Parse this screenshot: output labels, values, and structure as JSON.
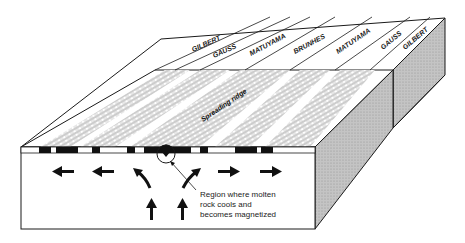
{
  "diagram": {
    "epoch_labels": [
      "GILBERT",
      "GAUSS",
      "MATUYAMA",
      "BRUNHES",
      "MATUYAMA",
      "GAUSS",
      "GILBERT"
    ],
    "ridge_label": "Spreading ridge",
    "annotation": {
      "line1": "Region where molten",
      "line2": "rock cools and",
      "line3": "becomes magnetized"
    },
    "arrows": {
      "left_flow": 2,
      "right_flow": 2,
      "upwelling": 2,
      "diverging": 2
    },
    "colors": {
      "stroke": "#1a1a1a",
      "side_fill": "#bdbdbd",
      "front_fill": "#ffffff",
      "stripe_black": "#111111"
    }
  }
}
